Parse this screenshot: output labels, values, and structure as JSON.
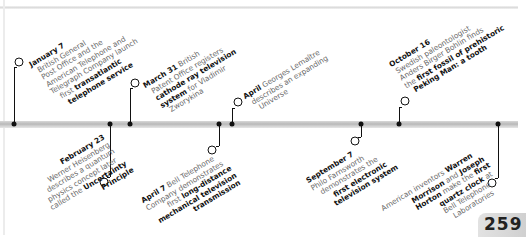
{
  "page": {
    "number": "259"
  },
  "events_above": [
    {
      "date": "January 7",
      "lines": [
        [
          "British General"
        ],
        [
          "Post Office and the"
        ],
        [
          "American Telephone and"
        ],
        [
          "Telegraph Company launch"
        ],
        [
          "first ",
          "transatlantic"
        ],
        [
          "telephone service"
        ]
      ],
      "text": "British General Post Office and the American Telephone and Telegraph Company launch first transatlantic telephone service",
      "highlight": "transatlantic telephone service"
    },
    {
      "date": "March 31",
      "lines": [
        "British",
        "Patent Office registers",
        "cathode ray television",
        "system for Vladimir",
        "Zworykina"
      ],
      "text": "British Patent Office registers cathode ray television system for Vladimir Zworykina",
      "highlight": "cathode ray television system"
    },
    {
      "date": "April",
      "lines": [
        "Georges Lemaître",
        "describes an expanding",
        "Universe"
      ],
      "text": "Georges Lemaître describes an expanding Universe",
      "highlight": ""
    },
    {
      "date": "October 16",
      "lines": [
        "Swedish paleontologist",
        "Anders Birger Bohlin finds",
        "the first fossil of prehistoric",
        "Peking Man: a tooth"
      ],
      "text": "Swedish paleontologist Anders Birger Bohlin finds the first fossil of prehistoric Peking Man: a tooth",
      "highlight": "first fossil of prehistoric Peking Man: a tooth"
    }
  ],
  "events_below": [
    {
      "date": "February 23",
      "lines": [
        "Werner Heisenberg",
        "describes a quantum",
        "physics concept later",
        "called the Uncertainty",
        "Principle"
      ],
      "text": "Werner Heisenberg describes a quantum physics concept later called the Uncertainty Principle",
      "highlight": "Uncertainty Principle"
    },
    {
      "date": "April 7",
      "lines": [
        "Bell Telephone",
        "Company demonstrates",
        "first long-distance",
        "mechanical television",
        "transmission"
      ],
      "text": "Bell Telephone Company demonstrates first long-distance mechanical television transmission",
      "highlight": "long-distance mechanical television transmission"
    },
    {
      "date": "September 7",
      "lines": [
        "Philo Farnsworth",
        "demonstrates the",
        "first electronic",
        "television system"
      ],
      "text": "Philo Farnsworth demonstrates the first electronic television system",
      "highlight": "first electronic television system"
    },
    {
      "date": "",
      "lines": [
        "American inventors Warren",
        "Morrison and Joseph",
        "Horton make the first",
        "quartz clock at",
        "Bell Telephone",
        "Laboratories"
      ],
      "text": "American inventors Warren Morrison and Joseph Horton make the first quartz clock at Bell Telephone Laboratories",
      "highlight": "Warren Morrison, Joseph Horton, first quartz clock"
    }
  ],
  "text": {
    "jan_date": "January 7",
    "jan_l1": "British General",
    "jan_l2": "Post Office and the",
    "jan_l3": "American Telephone and",
    "jan_l4": "Telegraph Company launch",
    "jan_l5a": "first ",
    "jan_l5b": "transatlantic",
    "jan_l6": "telephone service",
    "mar_date": "March 31",
    "mar_l1": " British",
    "mar_l2": "Patent Office registers",
    "mar_l3": "cathode ray television",
    "mar_l4a": "system",
    "mar_l4b": " for Vladimir",
    "mar_l5": "Zworykina",
    "apr_date": "April",
    "apr_l1": " Georges Lemaître",
    "apr_l2": "describes an expanding",
    "apr_l3": "Universe",
    "oct_date": "October 16",
    "oct_l1": "Swedish paleontologist",
    "oct_l2": "Anders Birger Bohlin finds",
    "oct_l3a": "the ",
    "oct_l3b": "first fossil of prehistoric",
    "oct_l4": "Peking Man: a tooth",
    "feb_date": "February 23",
    "feb_l1": "Werner Heisenberg",
    "feb_l2": "describes a quantum",
    "feb_l3": "physics concept later",
    "feb_l4a": "called the ",
    "feb_l4b": "Uncertainty",
    "feb_l5": "Principle",
    "apr7_date": "April 7",
    "apr7_l1": " Bell Telephone",
    "apr7_l2": "Company demonstrates",
    "apr7_l3a": "first ",
    "apr7_l3b": "long-distance",
    "apr7_l4": "mechanical television",
    "apr7_l5": "transmission",
    "sep_date": "September 7",
    "sep_l1": "Philo Farnsworth",
    "sep_l2": "demonstrates the",
    "sep_l3": "first electronic",
    "sep_l4": "television system",
    "qc_l1a": "American inventors ",
    "qc_l1b": "Warren",
    "qc_l2a": "Morrison",
    "qc_l2b": " and ",
    "qc_l2c": "Joseph",
    "qc_l3a": "Horton",
    "qc_l3b": " make the ",
    "qc_l3c": "first",
    "qc_l4a": "quartz clock",
    "qc_l4b": " at",
    "qc_l5": "Bell Telephone",
    "qc_l6": "Laboratories"
  },
  "colors": {
    "axis": "#c0c0c0",
    "marker": "#111111",
    "body_text": "#6a6a6a",
    "emphasis_text": "#111111",
    "page_tab": "#d6d6d6"
  }
}
